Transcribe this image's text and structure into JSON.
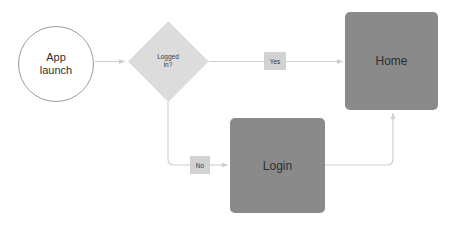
{
  "diagram": {
    "background_color": "#ffffff",
    "edge_color": "#d0d0d0",
    "nodes": {
      "start": {
        "id": "start",
        "shape": "circle",
        "label_line1": "App",
        "label_line2": "launch",
        "fill": "#ffffff",
        "stroke": "#9a9a9a",
        "text_color": "#2f2f2f"
      },
      "decision": {
        "id": "decision",
        "shape": "diamond",
        "label_line1": "Logged",
        "label_line2": "in?",
        "fill": "#dcdcdc",
        "text_color": "#3a3a3a"
      },
      "home": {
        "id": "home",
        "shape": "rounded-rect",
        "label": "Home",
        "fill": "#8a8a8a",
        "text_color": "#2e2e2e"
      },
      "login": {
        "id": "login",
        "shape": "rounded-rect",
        "label": "Login",
        "fill": "#8a8a8a",
        "text_color": "#2e2e2e"
      }
    },
    "edges": [
      {
        "id": "start-to-decision",
        "from": "start",
        "to": "decision",
        "label": "",
        "arrow": true
      },
      {
        "id": "decision-to-home",
        "from": "decision",
        "to": "home",
        "label": "Yes",
        "arrow": true
      },
      {
        "id": "decision-to-login",
        "from": "decision",
        "to": "login",
        "label": "No",
        "arrow": true
      },
      {
        "id": "login-to-home",
        "from": "login",
        "to": "home",
        "label": "",
        "arrow": true
      }
    ],
    "edge_labels": {
      "yes": "Yes",
      "no": "No"
    }
  }
}
